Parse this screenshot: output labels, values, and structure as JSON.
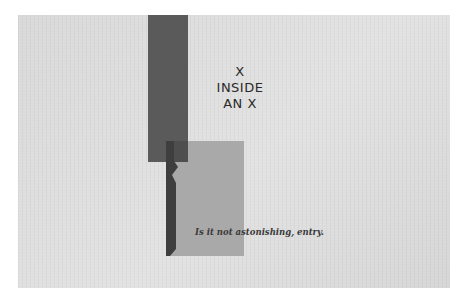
{
  "image": {
    "headline_lines": [
      "X",
      "INSIDE",
      "AN X"
    ],
    "caption": "Is it not astonishing, entry.",
    "colors": {
      "paper": "#dcdcdc",
      "dark_bar": "#5a5a5a",
      "light_square": "#a9a9a9",
      "silhouette": "#3e3e3e",
      "text": "#2a2a2a"
    }
  }
}
